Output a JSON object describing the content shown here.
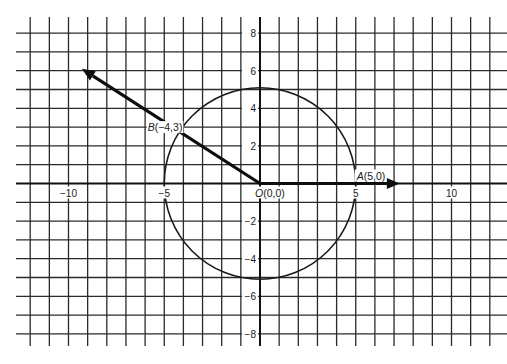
{
  "chart_data": {
    "type": "diagram",
    "title": "",
    "coordinate_plane": {
      "x_range": [
        -12,
        12.7
      ],
      "y_range": [
        -8.6,
        8.6
      ],
      "grid_step": 1,
      "grid": true,
      "x_tick_labels": [
        {
          "value": -10,
          "text": "−10"
        },
        {
          "value": -5,
          "text": "−5"
        },
        {
          "value": 5,
          "text": "5"
        },
        {
          "value": 10,
          "text": "10"
        }
      ],
      "y_tick_labels": [
        {
          "value": 8,
          "text": "8"
        },
        {
          "value": 6,
          "text": "6"
        },
        {
          "value": 4,
          "text": "4"
        },
        {
          "value": 2,
          "text": "2"
        },
        {
          "value": -2,
          "text": "−2"
        },
        {
          "value": -4,
          "text": "−4"
        },
        {
          "value": -6,
          "text": "−6"
        },
        {
          "value": -8,
          "text": "−8"
        }
      ]
    },
    "circle": {
      "center": [
        0,
        0
      ],
      "radius": 5
    },
    "points": [
      {
        "name": "O",
        "coords": "(0,0)",
        "x": 0,
        "y": 0
      },
      {
        "name": "A",
        "coords": "(5,0)",
        "x": 5,
        "y": 0
      },
      {
        "name": "B",
        "coords": "(−4,3)",
        "x": -4,
        "y": 3
      }
    ],
    "vectors": [
      {
        "from": [
          0,
          0
        ],
        "to": [
          7.3,
          0
        ],
        "through": "A"
      },
      {
        "from": [
          0,
          0
        ],
        "to": [
          -9.3,
          6.1
        ],
        "through": "B"
      }
    ]
  },
  "labels": {
    "origin_name": "O",
    "origin_coords": "(0,0)",
    "a_name": "A",
    "a_coords": "(5,0)",
    "b_name": "B",
    "b_coords": "(−4,3)"
  },
  "colors": {
    "grid": "#2b2b2b",
    "ink": "#111111",
    "background": "#ffffff"
  }
}
